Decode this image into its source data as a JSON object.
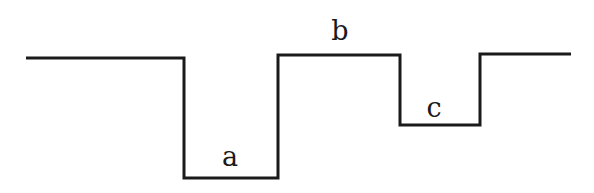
{
  "diagram": {
    "type": "step-profile",
    "stroke_color": "#1a1a1a",
    "background": "#ffffff",
    "path_points": [
      [
        26,
        58
      ],
      [
        184,
        58
      ],
      [
        184,
        178
      ],
      [
        278,
        178
      ],
      [
        278,
        55
      ],
      [
        400,
        55
      ],
      [
        400,
        125
      ],
      [
        480,
        125
      ],
      [
        480,
        54
      ],
      [
        571,
        54
      ]
    ],
    "labels": [
      {
        "id": "a",
        "text": "a",
        "x": 230,
        "y": 166
      },
      {
        "id": "b",
        "text": "b",
        "x": 340,
        "y": 40
      },
      {
        "id": "c",
        "text": "c",
        "x": 434,
        "y": 117
      }
    ]
  }
}
